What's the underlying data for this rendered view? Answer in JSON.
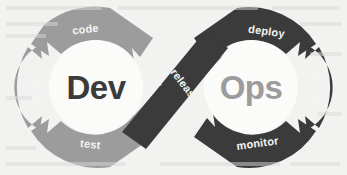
{
  "diagram": {
    "background_color": "#f2f2f1",
    "left_loop": {
      "core_label": "Dev",
      "core_label_color": "#3b3b3b",
      "ring_color": "#9c9c9c",
      "inner_circle_color": "#fbfbfa",
      "label_color": "#f4f4f3",
      "segments": [
        {
          "label": "code",
          "position": "top"
        },
        {
          "label": "build",
          "position": "left"
        },
        {
          "label": "test",
          "position": "bottom"
        }
      ]
    },
    "right_loop": {
      "core_label": "Ops",
      "core_label_color": "#9c9c9c",
      "ring_color": "#3b3b3b",
      "inner_circle_color": "#fbfbfa",
      "label_color": "#f4f4f3",
      "segments": [
        {
          "label": "deploy",
          "position": "top"
        },
        {
          "label": "operate",
          "position": "right"
        },
        {
          "label": "monitor",
          "position": "bottom"
        }
      ]
    },
    "crossing_bands": [
      {
        "label": "plan",
        "color": "#9c9c9c",
        "label_color": "#f4f4f3",
        "direction": "lower-left-to-upper-right",
        "layer": "under"
      },
      {
        "label": "release",
        "color": "#3b3b3b",
        "label_color": "#f4f4f3",
        "direction": "upper-right-to-lower-left",
        "layer": "over"
      }
    ]
  }
}
